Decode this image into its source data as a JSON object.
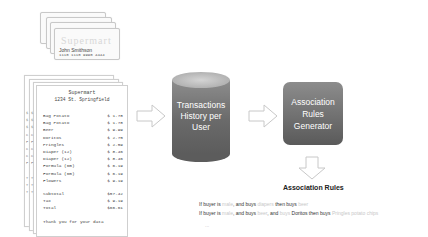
{
  "cards": {
    "brand": "Supermart",
    "holder_name": "John Smithson",
    "number": "1110 1110 9990 4444"
  },
  "receipts": {
    "stack_headers": [
      "Supermart",
      "Supermart",
      "Supermart"
    ],
    "store_name": "Supermart",
    "address": "1234 St. Springfield",
    "items": [
      {
        "name": "Bag Potato",
        "price": "$ 1.78"
      },
      {
        "name": "Bag Potato",
        "price": "$ 1.78"
      },
      {
        "name": "Beer",
        "price": "$ 9.99"
      },
      {
        "name": "Doritos",
        "price": "$ 2.75"
      },
      {
        "name": "Pringles",
        "price": "$ 2.59"
      },
      {
        "name": "Diaper (12)",
        "price": "$ 8.46"
      },
      {
        "name": "Diaper (12)",
        "price": "$ 8.46"
      },
      {
        "name": "Formula (6m)",
        "price": "$ 6.19"
      },
      {
        "name": "Formula (6m)",
        "price": "$ 6.19"
      },
      {
        "name": "Flowers",
        "price": "$ 9.19"
      }
    ],
    "subtotal_label": "Subtotal",
    "subtotal": "$57.42",
    "tax_label": "Tax",
    "tax": "$ 9.19",
    "total_label": "Total",
    "total": "$66.61",
    "thanks": "Thank you for your data"
  },
  "diagram": {
    "database_label_lines": [
      "Transactions",
      "History per",
      "User"
    ],
    "generator_label_lines": [
      "Association",
      "Rules",
      "Generator"
    ],
    "output_title": "Association Rules",
    "colors": {
      "node_fill_dark": "#5c5c5c",
      "node_fill_light": "#8c8c8c",
      "arrow_stroke": "#c8c8c8",
      "faint_text": "#c8c8c8"
    }
  },
  "rules": [
    {
      "parts": [
        {
          "t": "If buyer is ",
          "faint": false
        },
        {
          "t": "male",
          "faint": true
        },
        {
          "t": ", and buys ",
          "faint": false
        },
        {
          "t": "diapers",
          "faint": true
        },
        {
          "t": " then buys ",
          "faint": false
        },
        {
          "t": "beer",
          "faint": true
        }
      ]
    },
    {
      "parts": [
        {
          "t": "If buyer is ",
          "faint": false
        },
        {
          "t": "male",
          "faint": true
        },
        {
          "t": ", and buys ",
          "faint": false
        },
        {
          "t": "beer",
          "faint": true
        },
        {
          "t": ", and ",
          "faint": false
        },
        {
          "t": "buys",
          "faint": true
        },
        {
          "t": " Doritos then buys ",
          "faint": false
        },
        {
          "t": "Pringles potato chips",
          "faint": true
        }
      ]
    }
  ],
  "rules_ellipsis": "..."
}
